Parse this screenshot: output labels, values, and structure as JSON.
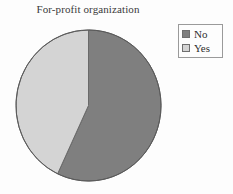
{
  "chart_data": {
    "type": "pie",
    "title": "For-profit organization",
    "xlabel": "",
    "ylabel": "",
    "categories": [
      "No",
      "Yes"
    ],
    "values": [
      57,
      43
    ],
    "units": "percent",
    "slice_colors": [
      "#7f7f7f",
      "#d4d4d4"
    ],
    "start_angle_deg": 0,
    "direction": "clockwise",
    "legend": {
      "position": "right",
      "entries": [
        {
          "label": "No",
          "color": "#7f7f7f"
        },
        {
          "label": "Yes",
          "color": "#d4d4d4"
        }
      ]
    },
    "grid": false,
    "outline_color": "#5a5a5a",
    "background": "#fdfdfd"
  },
  "chart": {
    "title": "For-profit organization"
  },
  "legend": {
    "entries": [
      {
        "label": "No"
      },
      {
        "label": "Yes"
      }
    ]
  }
}
